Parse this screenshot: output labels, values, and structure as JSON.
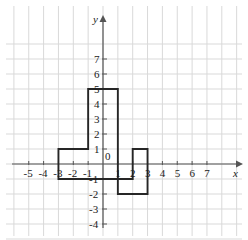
{
  "figure": {
    "kind": "cartesian-coordinate-plane-with-polygon",
    "background_color": "#ffffff",
    "outer_color": "#f2f2f2"
  },
  "axes": {
    "x_axis_label": "x",
    "y_axis_label": "y",
    "origin_label": "0",
    "axis_color": "#555555",
    "grid_color": "#d9d9d9",
    "x_tick_labels": [
      "-5",
      "-4",
      "-3",
      "-2",
      "-1",
      "1",
      "2",
      "3",
      "4",
      "5",
      "6",
      "7"
    ],
    "x_tick_values": [
      -5,
      -4,
      -3,
      -2,
      -1,
      1,
      2,
      3,
      4,
      5,
      6,
      7
    ],
    "y_tick_labels": [
      "7",
      "6",
      "5",
      "4",
      "3",
      "2",
      "1",
      "-1",
      "-2",
      "-3",
      "-4"
    ],
    "y_tick_values": [
      7,
      6,
      5,
      4,
      3,
      2,
      1,
      -1,
      -2,
      -3,
      -4
    ],
    "xlim": [
      -6,
      8
    ],
    "ylim": [
      -5,
      8
    ],
    "grid": true,
    "arrow_x": true,
    "arrow_y": true
  },
  "chart_data": {
    "type": "line",
    "title": "",
    "xlabel": "x",
    "ylabel": "y",
    "xlim": [
      -6,
      8
    ],
    "ylim": [
      -5,
      8
    ],
    "grid": true,
    "legend": "none",
    "series": [
      {
        "name": "polygon-outline",
        "closed": true,
        "stroke_color": "#262626",
        "fill": "none",
        "points": [
          [
            -3,
            -1
          ],
          [
            -3,
            1
          ],
          [
            -1,
            1
          ],
          [
            -1,
            5
          ],
          [
            1,
            5
          ],
          [
            1,
            -2
          ],
          [
            3,
            -2
          ],
          [
            3,
            1
          ],
          [
            2,
            1
          ],
          [
            2,
            -1
          ],
          [
            -3,
            -1
          ]
        ]
      }
    ]
  }
}
